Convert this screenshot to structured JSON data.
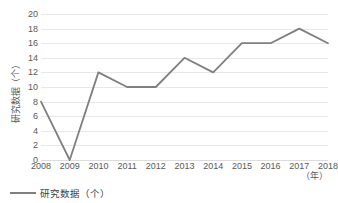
{
  "chart_data": {
    "type": "line",
    "title": "",
    "xlabel": "（年）",
    "ylabel": "研究数据（个）",
    "categories": [
      "2008",
      "2009",
      "2010",
      "2011",
      "2012",
      "2013",
      "2014",
      "2015",
      "2016",
      "2017",
      "2018"
    ],
    "series": [
      {
        "name": "研究数据（个）",
        "color": "#7f7f7f",
        "values": [
          8,
          0,
          12,
          10,
          10,
          14,
          12,
          16,
          16,
          18,
          16
        ]
      }
    ],
    "ylim": [
      0,
      20
    ],
    "ytick_step": 2,
    "yticks": [
      "20",
      "18",
      "16",
      "14",
      "12",
      "10",
      "8",
      "6",
      "4",
      "2",
      "0"
    ],
    "grid": "horizontal",
    "legend_position": "bottom-left"
  },
  "legend": {
    "entries": [
      {
        "label": "研究数据（个）",
        "color": "#7f7f7f"
      }
    ]
  },
  "axes": {
    "y_title": "研究数据（个）",
    "x_unit": "（年）"
  },
  "colors": {
    "background": "#ffffff",
    "series_line": "#7f7f7f",
    "gridline": "#e8e8e8",
    "baseline": "#dcdcdc",
    "tick_text": "#595959"
  }
}
